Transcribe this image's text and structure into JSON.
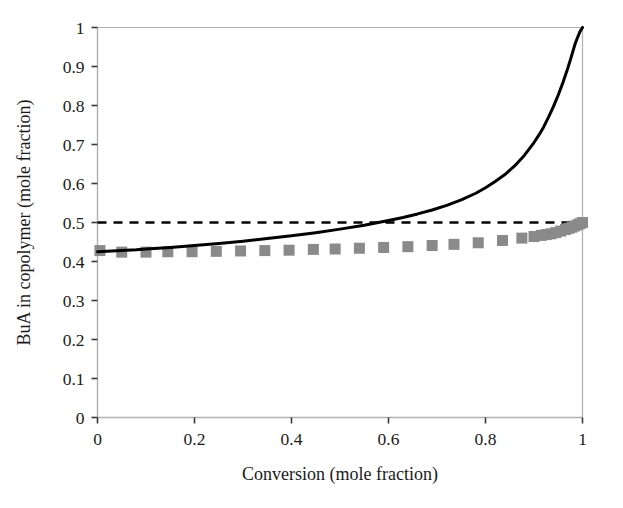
{
  "chart_data": {
    "type": "line",
    "title": "",
    "subtitle": "",
    "xlabel": "Conversion (mole fraction)",
    "ylabel": "BuA in copolymer (mole fraction)",
    "xlim": [
      0,
      1
    ],
    "ylim": [
      0,
      1
    ],
    "grid": false,
    "legend_position": "none",
    "xticks": [
      0,
      0.2,
      0.4,
      0.6,
      0.8,
      1
    ],
    "xtick_labels": [
      "0",
      "0.2",
      "0.4",
      "0.6",
      "0.8",
      "1"
    ],
    "yticks": [
      0,
      0.1,
      0.2,
      0.3,
      0.4,
      0.5,
      0.6,
      0.7,
      0.8,
      0.9,
      1
    ],
    "ytick_labels": [
      "0",
      "0.1",
      "0.2",
      "0.3",
      "0.4",
      "0.5",
      "0.6",
      "0.7",
      "0.8",
      "0.9",
      "1"
    ],
    "colors": {
      "instantaneous_line": "#000000",
      "reference_dashed_line": "#000000",
      "cumulative_markers": "#8a8a8a",
      "axis": "#b0b0b0",
      "background": "#ffffff"
    },
    "series": [
      {
        "name": "Instantaneous BuA in copolymer",
        "style": "solid-line",
        "color": "#000000",
        "linewidth": 3,
        "x": [
          0.0,
          0.02,
          0.05,
          0.08,
          0.1,
          0.15,
          0.2,
          0.25,
          0.3,
          0.35,
          0.4,
          0.45,
          0.5,
          0.55,
          0.6,
          0.63,
          0.66,
          0.69,
          0.72,
          0.75,
          0.78,
          0.8,
          0.82,
          0.84,
          0.86,
          0.88,
          0.9,
          0.91,
          0.92,
          0.93,
          0.94,
          0.95,
          0.96,
          0.97,
          0.975,
          0.98,
          0.985,
          0.99,
          0.995,
          1.0
        ],
        "y": [
          0.425,
          0.426,
          0.428,
          0.43,
          0.432,
          0.436,
          0.441,
          0.446,
          0.452,
          0.459,
          0.466,
          0.474,
          0.483,
          0.493,
          0.505,
          0.513,
          0.522,
          0.532,
          0.544,
          0.558,
          0.575,
          0.589,
          0.605,
          0.623,
          0.645,
          0.672,
          0.705,
          0.724,
          0.745,
          0.77,
          0.797,
          0.827,
          0.86,
          0.897,
          0.917,
          0.938,
          0.959,
          0.975,
          0.99,
          1.0
        ]
      },
      {
        "name": "Cumulative BuA in copolymer",
        "style": "square-markers",
        "color": "#8a8a8a",
        "marker_size": 11,
        "x": [
          0.005,
          0.05,
          0.1,
          0.145,
          0.195,
          0.245,
          0.295,
          0.345,
          0.395,
          0.445,
          0.49,
          0.54,
          0.59,
          0.64,
          0.69,
          0.735,
          0.785,
          0.835,
          0.875,
          0.9,
          0.915,
          0.925,
          0.935,
          0.945,
          0.955,
          0.965,
          0.972,
          0.978,
          0.984,
          0.99,
          0.995,
          1.0
        ],
        "y": [
          0.428,
          0.424,
          0.424,
          0.425,
          0.425,
          0.426,
          0.427,
          0.428,
          0.429,
          0.431,
          0.432,
          0.434,
          0.436,
          0.438,
          0.441,
          0.444,
          0.448,
          0.454,
          0.46,
          0.464,
          0.467,
          0.469,
          0.471,
          0.474,
          0.478,
          0.482,
          0.485,
          0.488,
          0.491,
          0.494,
          0.497,
          0.5
        ]
      },
      {
        "name": "Reference level 0.5",
        "style": "dashed-line",
        "color": "#000000",
        "linewidth": 2.6,
        "x": [
          0.0,
          1.0
        ],
        "y": [
          0.5,
          0.5
        ]
      }
    ],
    "annotations": []
  }
}
